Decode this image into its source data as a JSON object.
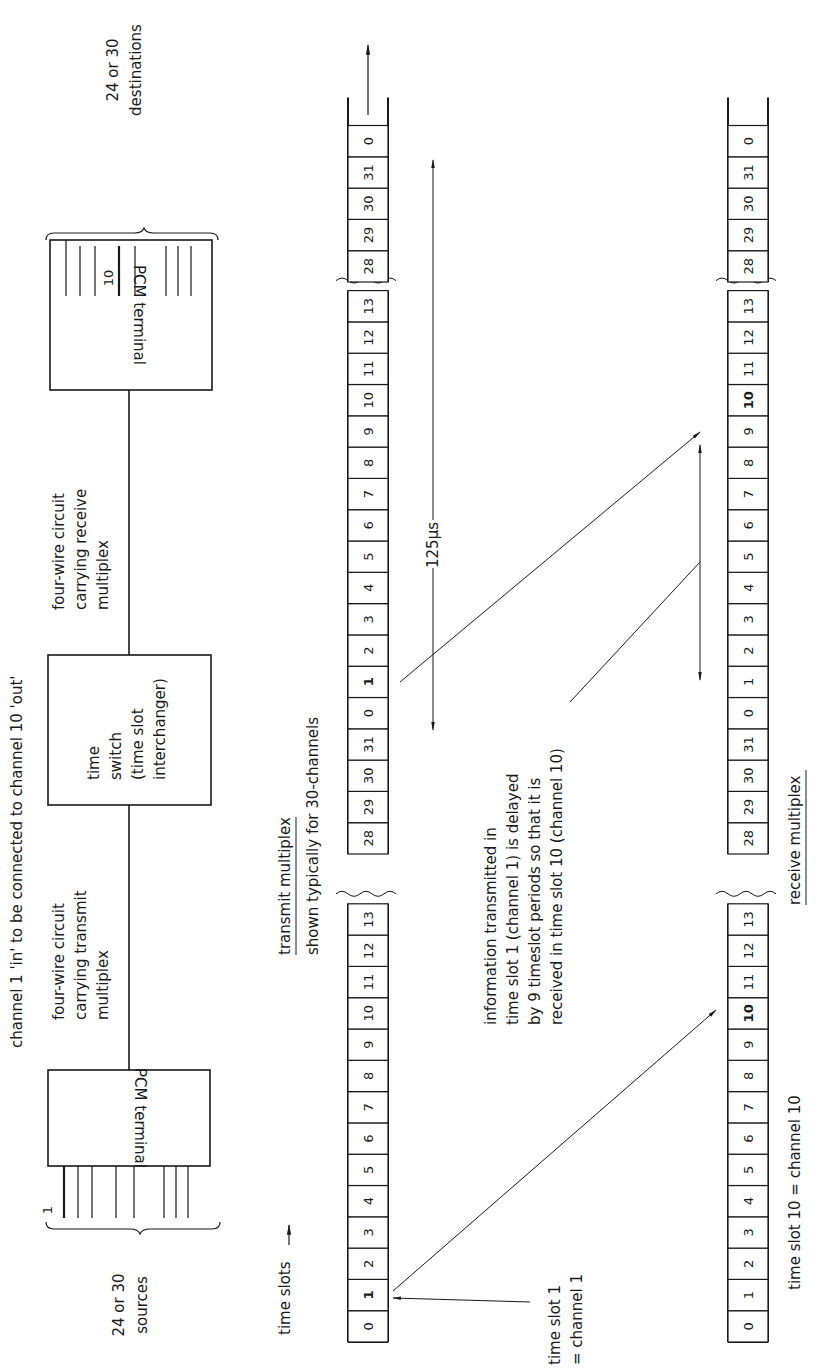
{
  "diagram": {
    "title": "channel 1 'in' to be connected to channel 10 'out'",
    "left_terminal": {
      "label": "PCM terminal",
      "input_marker": "1",
      "sources_label_line1": "24 or 30",
      "sources_label_line2": "sources"
    },
    "time_switch": {
      "line1": "time",
      "line2": "switch",
      "line3": "(time slot",
      "line4": "interchanger)"
    },
    "right_terminal": {
      "label": "PCM terminal",
      "output_marker": "10",
      "destinations_label_line1": "24 or 30",
      "destinations_label_line2": "destinations"
    },
    "transmit_circuit": {
      "line1": "four-wire circuit",
      "line2": "carrying transmit",
      "line3": "multiplex"
    },
    "receive_circuit": {
      "line1": "four-wire circuit",
      "line2": "carrying receive",
      "line3": "multiplex"
    },
    "transmit_multiplex": {
      "title": "transmit multiplex",
      "subtitle": "shown typically for 30-channels",
      "time_slots_label": "time slots",
      "slot1_note_line1": "time slot 1",
      "slot1_note_line2": "= channel 1",
      "frame1_slots": [
        "0",
        "1",
        "2",
        "3",
        "4",
        "5",
        "6",
        "7",
        "8",
        "9",
        "10",
        "11",
        "12",
        "13"
      ],
      "frame1_tail_slots": [
        "28",
        "29",
        "30",
        "31"
      ],
      "frame2_slots": [
        "0",
        "1",
        "2",
        "3",
        "4",
        "5",
        "6",
        "7",
        "8",
        "9",
        "10",
        "11",
        "12",
        "13"
      ],
      "frame2_tail_slots": [
        "28",
        "29",
        "30",
        "31",
        "0"
      ],
      "highlighted_slot": "1"
    },
    "receive_multiplex": {
      "title": "receive multiplex",
      "slot10_note": "time slot 10 = channel 10",
      "frame1_slots": [
        "0",
        "1",
        "2",
        "3",
        "4",
        "5",
        "6",
        "7",
        "8",
        "9",
        "10",
        "11",
        "12",
        "13"
      ],
      "frame1_tail_slots": [
        "28",
        "29",
        "30",
        "31"
      ],
      "frame2_slots": [
        "0",
        "1",
        "2",
        "3",
        "4",
        "5",
        "6",
        "7",
        "8",
        "9",
        "10",
        "11",
        "12",
        "13"
      ],
      "frame2_tail_slots": [
        "28",
        "29",
        "30",
        "31",
        "0"
      ],
      "highlighted_slot": "10"
    },
    "frame_period": "125µs",
    "delay_note": {
      "line1": "information transmitted in",
      "line2": "time slot 1 (channel 1) is delayed",
      "line3": "by 9 timeslot periods so that it is",
      "line4": "received in time slot 10 (channel 10)"
    }
  }
}
